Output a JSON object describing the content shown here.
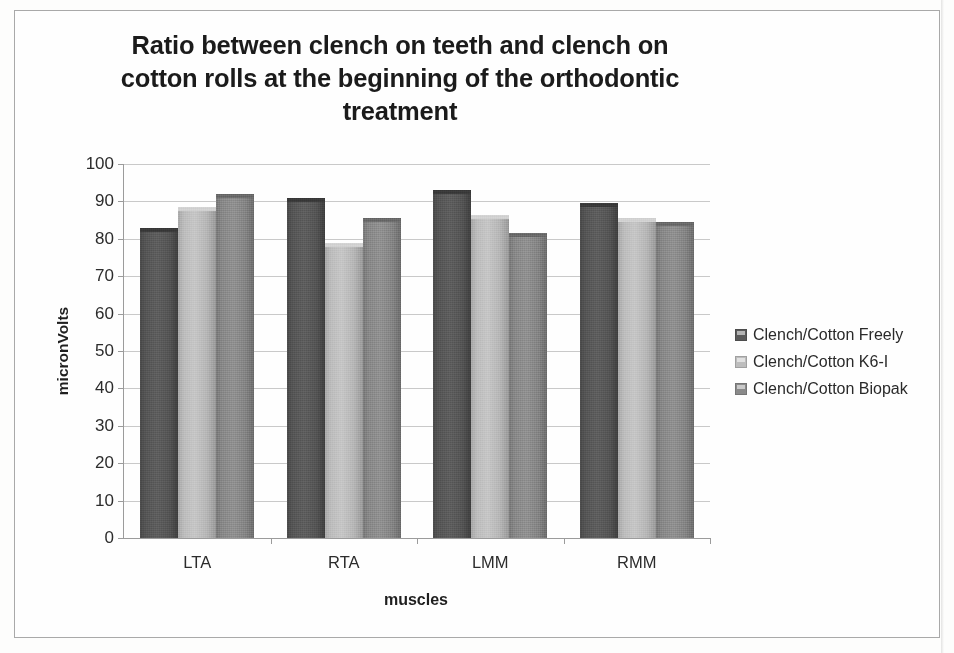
{
  "chart_data": {
    "type": "bar",
    "title": "Ratio between clench on teeth and clench on cotton rolls at the beginning of the orthodontic treatment",
    "title_lines": [
      "Ratio between clench on teeth and clench on",
      "cotton rolls at the beginning of the orthodontic",
      "treatment"
    ],
    "xlabel": "muscles",
    "ylabel": "micronVolts",
    "categories": [
      "LTA",
      "RTA",
      "LMM",
      "RMM"
    ],
    "series": [
      {
        "name": "Clench/Cotton Freely",
        "color": "#5a5a5a",
        "values": [
          83,
          91,
          93,
          89.5
        ]
      },
      {
        "name": "Clench/Cotton K6-I",
        "color": "#bdbdbd",
        "values": [
          88.5,
          79,
          86.5,
          85.5
        ]
      },
      {
        "name": "Clench/Cotton Biopak",
        "color": "#8a8a8a",
        "values": [
          92,
          85.5,
          81.5,
          84.5
        ]
      }
    ],
    "ylim": [
      0,
      100
    ],
    "ytick_step": 10,
    "yticks": [
      0,
      10,
      20,
      30,
      40,
      50,
      60,
      70,
      80,
      90,
      100
    ],
    "ytick_labels": [
      "0",
      "10",
      "20",
      "30",
      "40",
      "50",
      "60",
      "70",
      "80",
      "90",
      "100"
    ],
    "grid": true,
    "grid_axis": "y",
    "legend_position": "right"
  }
}
